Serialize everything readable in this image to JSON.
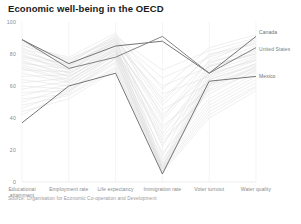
{
  "chart_data": {
    "type": "line",
    "subtype": "parallel-coordinates",
    "title": "Economic well-being in the OECD",
    "source": "Source: Organisation for Economic Co-operation and Development",
    "xlabel": "",
    "ylabel": "",
    "ylim": [
      0,
      100
    ],
    "yticks": [
      0,
      20,
      40,
      60,
      80,
      100
    ],
    "grid": false,
    "legend_position": "right-inline",
    "categories": [
      "Educational attainment",
      "Employment rate",
      "Life expectancy",
      "Immigration rate",
      "Voter turnout",
      "Water quality"
    ],
    "highlight_color": "#6e6e6e",
    "background_color": "#d8d8d8",
    "series": [
      {
        "name": "Canada",
        "highlight": true,
        "color": "#6e6e6e",
        "values": [
          89,
          74,
          85,
          88,
          68,
          91
        ]
      },
      {
        "name": "United States",
        "highlight": true,
        "color": "#7d7d7d",
        "values": [
          89,
          71,
          78,
          91,
          68,
          84
        ]
      },
      {
        "name": "Mexico",
        "highlight": true,
        "color": "#6e6e6e",
        "values": [
          37,
          60,
          68,
          5,
          63,
          66
        ]
      },
      {
        "name": "OECD country",
        "highlight": false,
        "color": "#dddddd",
        "values": [
          86,
          73,
          88,
          60,
          72,
          80
        ]
      },
      {
        "name": "OECD country",
        "highlight": false,
        "color": "#dddddd",
        "values": [
          84,
          70,
          86,
          55,
          66,
          78
        ]
      },
      {
        "name": "OECD country",
        "highlight": false,
        "color": "#dddddd",
        "values": [
          82,
          72,
          90,
          50,
          80,
          86
        ]
      },
      {
        "name": "OECD country",
        "highlight": false,
        "color": "#dddddd",
        "values": [
          80,
          68,
          84,
          45,
          62,
          74
        ]
      },
      {
        "name": "OECD country",
        "highlight": false,
        "color": "#dddddd",
        "values": [
          78,
          74,
          92,
          40,
          76,
          88
        ]
      },
      {
        "name": "OECD country",
        "highlight": false,
        "color": "#dddddd",
        "values": [
          76,
          66,
          82,
          35,
          58,
          72
        ]
      },
      {
        "name": "OECD country",
        "highlight": false,
        "color": "#dddddd",
        "values": [
          74,
          71,
          87,
          30,
          70,
          83
        ]
      },
      {
        "name": "OECD country",
        "highlight": false,
        "color": "#dddddd",
        "values": [
          72,
          64,
          80,
          26,
          55,
          70
        ]
      },
      {
        "name": "OECD country",
        "highlight": false,
        "color": "#dddddd",
        "values": [
          70,
          69,
          89,
          22,
          74,
          85
        ]
      },
      {
        "name": "OECD country",
        "highlight": false,
        "color": "#dddddd",
        "values": [
          68,
          62,
          79,
          18,
          52,
          68
        ]
      },
      {
        "name": "OECD country",
        "highlight": false,
        "color": "#dddddd",
        "values": [
          66,
          67,
          86,
          16,
          72,
          81
        ]
      },
      {
        "name": "OECD country",
        "highlight": false,
        "color": "#dddddd",
        "values": [
          64,
          60,
          77,
          14,
          50,
          66
        ]
      },
      {
        "name": "OECD country",
        "highlight": false,
        "color": "#dddddd",
        "values": [
          62,
          65,
          84,
          12,
          69,
          79
        ]
      },
      {
        "name": "OECD country",
        "highlight": false,
        "color": "#dddddd",
        "values": [
          60,
          58,
          75,
          11,
          48,
          64
        ]
      },
      {
        "name": "OECD country",
        "highlight": false,
        "color": "#dddddd",
        "values": [
          58,
          63,
          83,
          10,
          67,
          77
        ]
      },
      {
        "name": "OECD country",
        "highlight": false,
        "color": "#dddddd",
        "values": [
          56,
          57,
          74,
          9,
          46,
          62
        ]
      },
      {
        "name": "OECD country",
        "highlight": false,
        "color": "#dddddd",
        "values": [
          54,
          61,
          81,
          9,
          65,
          76
        ]
      },
      {
        "name": "OECD country",
        "highlight": false,
        "color": "#dddddd",
        "values": [
          52,
          55,
          72,
          8,
          44,
          60
        ]
      },
      {
        "name": "OECD country",
        "highlight": false,
        "color": "#dddddd",
        "values": [
          50,
          59,
          80,
          8,
          64,
          74
        ]
      },
      {
        "name": "OECD country",
        "highlight": false,
        "color": "#dddddd",
        "values": [
          48,
          54,
          71,
          7,
          42,
          59
        ]
      },
      {
        "name": "OECD country",
        "highlight": false,
        "color": "#dddddd",
        "values": [
          46,
          57,
          78,
          7,
          61,
          72
        ]
      },
      {
        "name": "OECD country",
        "highlight": false,
        "color": "#dddddd",
        "values": [
          44,
          52,
          70,
          6,
          40,
          57
        ]
      },
      {
        "name": "OECD country",
        "highlight": false,
        "color": "#dddddd",
        "values": [
          42,
          56,
          77,
          6,
          60,
          70
        ]
      },
      {
        "name": "OECD country",
        "highlight": false,
        "color": "#dddddd",
        "values": [
          88,
          76,
          91,
          70,
          82,
          90
        ]
      },
      {
        "name": "OECD country",
        "highlight": false,
        "color": "#dddddd",
        "values": [
          87,
          75,
          90,
          65,
          78,
          87
        ]
      },
      {
        "name": "OECD country",
        "highlight": false,
        "color": "#dddddd",
        "values": [
          85,
          78,
          93,
          58,
          84,
          92
        ]
      },
      {
        "name": "OECD country",
        "highlight": false,
        "color": "#dddddd",
        "values": [
          83,
          77,
          89,
          52,
          79,
          89
        ]
      },
      {
        "name": "OECD country",
        "highlight": false,
        "color": "#dddddd",
        "values": [
          81,
          73,
          88,
          48,
          75,
          82
        ]
      },
      {
        "name": "OECD country",
        "highlight": false,
        "color": "#dddddd",
        "values": [
          79,
          70,
          85,
          42,
          68,
          76
        ]
      },
      {
        "name": "OECD country",
        "highlight": false,
        "color": "#dddddd",
        "values": [
          77,
          72,
          87,
          38,
          73,
          80
        ]
      },
      {
        "name": "OECD country",
        "highlight": false,
        "color": "#dddddd",
        "values": [
          75,
          68,
          83,
          33,
          64,
          73
        ]
      },
      {
        "name": "OECD country",
        "highlight": false,
        "color": "#dddddd",
        "values": [
          73,
          66,
          82,
          28,
          61,
          71
        ]
      },
      {
        "name": "OECD country",
        "highlight": false,
        "color": "#dddddd",
        "values": [
          71,
          63,
          81,
          24,
          57,
          69
        ]
      }
    ]
  }
}
